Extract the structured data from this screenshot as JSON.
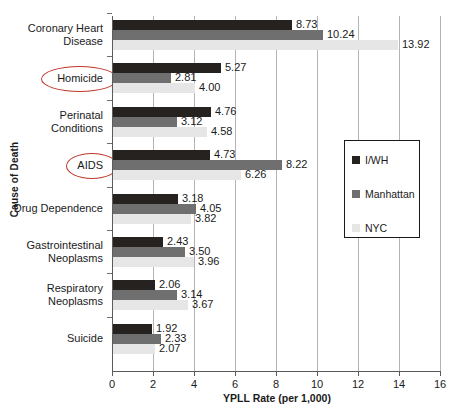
{
  "chart_data": {
    "type": "bar",
    "orientation": "horizontal",
    "title": "",
    "xlabel": "YPLL Rate (per 1,000)",
    "ylabel": "Cause of Death",
    "xlim": [
      0,
      16
    ],
    "xticks": [
      0,
      2,
      4,
      6,
      8,
      10,
      12,
      14,
      16
    ],
    "grid": true,
    "legend_position": "center-right",
    "categories": [
      "Coronary Heart Disease",
      "Homicide",
      "Perinatal Conditions",
      "AIDS",
      "Drug Dependence",
      "Gastrointestinal Neoplasms",
      "Respiratory Neoplasms",
      "Suicide"
    ],
    "category_lines": [
      [
        "Coronary Heart",
        "Disease"
      ],
      [
        "Homicide"
      ],
      [
        "Perinatal",
        "Conditions"
      ],
      [
        "AIDS"
      ],
      [
        "Drug Dependence"
      ],
      [
        "Gastrointestinal",
        "Neoplasms"
      ],
      [
        "Respiratory",
        "Neoplasms"
      ],
      [
        "Suicide"
      ]
    ],
    "highlighted_categories": [
      "Homicide",
      "AIDS"
    ],
    "series": [
      {
        "name": "I/WH",
        "color": "#262220",
        "values": [
          8.73,
          5.27,
          4.76,
          4.73,
          3.18,
          2.43,
          2.06,
          1.92
        ],
        "labels": [
          "8.73",
          "5.27",
          "4.76",
          "4.73",
          "3.18",
          "2.43",
          "2.06",
          "1.92"
        ]
      },
      {
        "name": "Manhattan",
        "color": "#6f6f6f",
        "values": [
          10.24,
          2.81,
          3.12,
          8.22,
          4.05,
          3.5,
          3.14,
          2.33
        ],
        "labels": [
          "10.24",
          "2.81",
          "3.12",
          "8.22",
          "4.05",
          "3.50",
          "3.14",
          "2.33"
        ]
      },
      {
        "name": "NYC",
        "color": "#e6e6e6",
        "values": [
          13.92,
          4.0,
          4.58,
          6.26,
          3.82,
          3.96,
          3.67,
          2.07
        ],
        "labels": [
          "13.92",
          "4.00",
          "4.58",
          "6.26",
          "3.82",
          "3.96",
          "3.67",
          "2.07"
        ]
      }
    ]
  },
  "legend": {
    "items": [
      {
        "label": "I/WH",
        "color": "#262220"
      },
      {
        "label": "Manhattan",
        "color": "#6f6f6f"
      },
      {
        "label": "NYC",
        "color": "#e6e6e6"
      }
    ]
  },
  "axes": {
    "x_title": "YPLL Rate (per 1,000)",
    "y_title": "Cause of Death",
    "x_tick_labels": [
      "0",
      "2",
      "4",
      "6",
      "8",
      "10",
      "12",
      "14",
      "16"
    ]
  },
  "colors": {
    "iwh": "#262220",
    "manhattan": "#6f6f6f",
    "nyc": "#e6e6e6",
    "highlight": "#c0392b",
    "axis": "#5b5b5b",
    "grid": "#b4b4b4"
  }
}
